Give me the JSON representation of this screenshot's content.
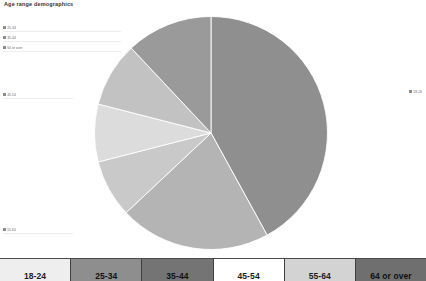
{
  "chart": {
    "title": "Age range demographics"
  },
  "chart_data": {
    "type": "pie",
    "title": "Age range demographics",
    "xlabel": "",
    "ylabel": "",
    "legend_position": "bottom",
    "grid": false,
    "categories": [
      "18-24",
      "25-34",
      "35-44",
      "45-54",
      "55-64",
      "64 or over"
    ],
    "values": [
      42,
      21,
      8,
      8,
      9,
      12
    ],
    "colors": [
      "#8f8f8f",
      "#b4b4b4",
      "#c9c9c9",
      "#dcdcdc",
      "#c2c2c2",
      "#9a9a9a"
    ],
    "slices": [
      {
        "label": "18-24",
        "value": 42,
        "color": "#8f8f8f"
      },
      {
        "label": "25-34",
        "value": 21,
        "color": "#b4b4b4"
      },
      {
        "label": "35-44",
        "value": 8,
        "color": "#c9c9c9"
      },
      {
        "label": "45-54",
        "value": 8,
        "color": "#dcdcdc"
      },
      {
        "label": "55-64",
        "value": 9,
        "color": "#c2c2c2"
      },
      {
        "label": "64 or over",
        "value": 12,
        "color": "#9a9a9a"
      }
    ]
  },
  "axis_stubs": [
    {
      "label": "25-34",
      "top": 26
    },
    {
      "label": "35-44",
      "top": 36
    },
    {
      "label": "64 or over",
      "top": 46
    },
    {
      "label": "45-54",
      "top": 93
    },
    {
      "label": "55-64",
      "top": 228
    }
  ],
  "right_stub": {
    "label": "18-24"
  },
  "key_table": {
    "cells": [
      {
        "label": "18-24",
        "color": "#eeeeee"
      },
      {
        "label": "25-34",
        "color": "#8e8e8e"
      },
      {
        "label": "35-44",
        "color": "#747474"
      },
      {
        "label": "45-54",
        "color": "#ffffff"
      },
      {
        "label": "55-64",
        "color": "#d3d3d3"
      },
      {
        "label": "64 or over",
        "color": "#6f6f6f"
      }
    ]
  }
}
